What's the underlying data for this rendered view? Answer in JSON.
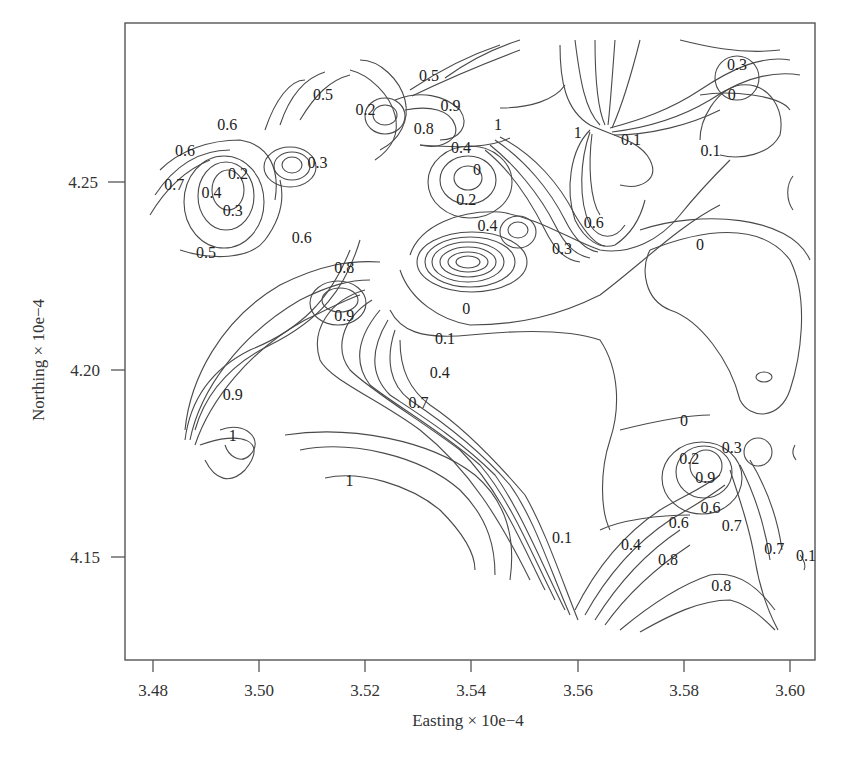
{
  "chart_data": {
    "type": "contour",
    "title": "",
    "xlabel": "Easting × 10e−4",
    "ylabel": "Northing × 10e−4",
    "xlim": [
      3.475,
      3.605
    ],
    "ylim": [
      4.13,
      4.3
    ],
    "xticks": [
      "3.48",
      "3.50",
      "3.52",
      "3.54",
      "3.56",
      "3.58",
      "3.60"
    ],
    "yticks": [
      "4.15",
      "4.20",
      "4.25"
    ],
    "grid": false,
    "legend": null,
    "contour_levels": [
      0,
      0.1,
      0.2,
      0.3,
      0.4,
      0.5,
      0.6,
      0.7,
      0.8,
      0.9,
      1
    ],
    "contour_labels": [
      {
        "text": "0.5",
        "x": 3.512,
        "y": 4.272
      },
      {
        "text": "0.5",
        "x": 3.532,
        "y": 4.277
      },
      {
        "text": "0.2",
        "x": 3.52,
        "y": 4.268
      },
      {
        "text": "0.9",
        "x": 3.536,
        "y": 4.269
      },
      {
        "text": "0.8",
        "x": 3.531,
        "y": 4.263
      },
      {
        "text": "1",
        "x": 3.545,
        "y": 4.264
      },
      {
        "text": "0.4",
        "x": 3.538,
        "y": 4.258
      },
      {
        "text": "1",
        "x": 3.56,
        "y": 4.262
      },
      {
        "text": "0.1",
        "x": 3.57,
        "y": 4.26
      },
      {
        "text": "0.3",
        "x": 3.59,
        "y": 4.28
      },
      {
        "text": "0",
        "x": 3.589,
        "y": 4.272
      },
      {
        "text": "0.1",
        "x": 3.585,
        "y": 4.257
      },
      {
        "text": "0.6",
        "x": 3.494,
        "y": 4.264
      },
      {
        "text": "0.6",
        "x": 3.486,
        "y": 4.257
      },
      {
        "text": "0.3",
        "x": 3.511,
        "y": 4.254
      },
      {
        "text": "0.2",
        "x": 3.496,
        "y": 4.251
      },
      {
        "text": "0.7",
        "x": 3.484,
        "y": 4.248
      },
      {
        "text": "0.4",
        "x": 3.491,
        "y": 4.246
      },
      {
        "text": "0.3",
        "x": 3.495,
        "y": 4.241
      },
      {
        "text": "0",
        "x": 3.541,
        "y": 4.252
      },
      {
        "text": "0.2",
        "x": 3.539,
        "y": 4.244
      },
      {
        "text": "0.4",
        "x": 3.543,
        "y": 4.237
      },
      {
        "text": "0.6",
        "x": 3.563,
        "y": 4.238
      },
      {
        "text": "0.3",
        "x": 3.557,
        "y": 4.231
      },
      {
        "text": "0.6",
        "x": 3.508,
        "y": 4.234
      },
      {
        "text": "0.5",
        "x": 3.49,
        "y": 4.23
      },
      {
        "text": "0",
        "x": 3.583,
        "y": 4.232
      },
      {
        "text": "0.8",
        "x": 3.516,
        "y": 4.226
      },
      {
        "text": "0.9",
        "x": 3.516,
        "y": 4.213
      },
      {
        "text": "0",
        "x": 3.539,
        "y": 4.215
      },
      {
        "text": "0.1",
        "x": 3.535,
        "y": 4.207
      },
      {
        "text": "0.4",
        "x": 3.534,
        "y": 4.198
      },
      {
        "text": "0.9",
        "x": 3.495,
        "y": 4.192
      },
      {
        "text": "0.7",
        "x": 3.53,
        "y": 4.19
      },
      {
        "text": "1",
        "x": 3.495,
        "y": 4.181
      },
      {
        "text": "0",
        "x": 3.58,
        "y": 4.185
      },
      {
        "text": "0.3",
        "x": 3.589,
        "y": 4.178
      },
      {
        "text": "0.2",
        "x": 3.581,
        "y": 4.175
      },
      {
        "text": "0.9",
        "x": 3.584,
        "y": 4.17
      },
      {
        "text": "1",
        "x": 3.517,
        "y": 4.169
      },
      {
        "text": "0.6",
        "x": 3.585,
        "y": 4.162
      },
      {
        "text": "0.6",
        "x": 3.579,
        "y": 4.158
      },
      {
        "text": "0.7",
        "x": 3.589,
        "y": 4.157
      },
      {
        "text": "0.1",
        "x": 3.557,
        "y": 4.154
      },
      {
        "text": "0.4",
        "x": 3.57,
        "y": 4.152
      },
      {
        "text": "0.8",
        "x": 3.577,
        "y": 4.148
      },
      {
        "text": "0.7",
        "x": 3.597,
        "y": 4.151
      },
      {
        "text": "0.1",
        "x": 3.603,
        "y": 4.149
      },
      {
        "text": "0.8",
        "x": 3.587,
        "y": 4.141
      }
    ]
  }
}
